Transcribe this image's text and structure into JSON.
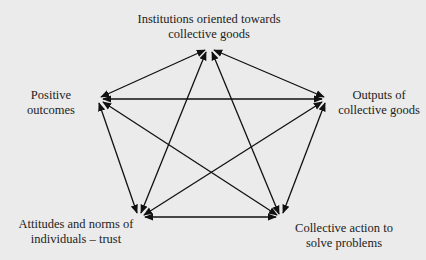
{
  "diagram": {
    "type": "pentagram-relationship-diagram",
    "nodes": [
      {
        "id": "institutions",
        "line1": "Institutions oriented towards",
        "line2": "collective goods"
      },
      {
        "id": "positive",
        "line1": "Positive",
        "line2": "outcomes"
      },
      {
        "id": "outputs",
        "line1": "Outputs of",
        "line2": "collective goods"
      },
      {
        "id": "attitudes",
        "line1": "Attitudes and norms of",
        "line2": "individuals – trust"
      },
      {
        "id": "action",
        "line1": "Collective action to",
        "line2": "solve problems"
      }
    ],
    "edges": [
      {
        "from": "institutions",
        "to": "positive",
        "bidirectional": true
      },
      {
        "from": "institutions",
        "to": "outputs",
        "bidirectional": true
      },
      {
        "from": "institutions",
        "to": "attitudes",
        "bidirectional": true
      },
      {
        "from": "institutions",
        "to": "action",
        "bidirectional": true
      },
      {
        "from": "positive",
        "to": "outputs",
        "bidirectional": true
      },
      {
        "from": "positive",
        "to": "attitudes",
        "bidirectional": true
      },
      {
        "from": "positive",
        "to": "action",
        "bidirectional": true
      },
      {
        "from": "outputs",
        "to": "attitudes",
        "bidirectional": true
      },
      {
        "from": "outputs",
        "to": "action",
        "bidirectional": true
      },
      {
        "from": "attitudes",
        "to": "action",
        "bidirectional": true
      }
    ],
    "colors": {
      "background": "#ebebeb",
      "line": "#111111",
      "text": "#222222"
    }
  }
}
